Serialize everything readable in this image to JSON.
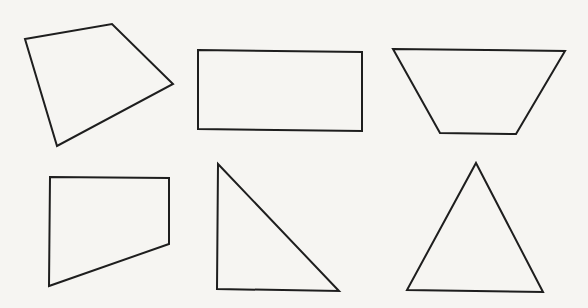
{
  "figure": {
    "width": 588,
    "height": 308,
    "background": "#f6f5f2",
    "stroke_color": "#1e1e1e",
    "shapes": [
      {
        "id": "irregular-quadrilateral",
        "type": "quadrilateral",
        "points": "25,39 112,24 173,84 57,146"
      },
      {
        "id": "rectangle",
        "type": "rectangle",
        "points": "198,50 362,52 362,131 198,129"
      },
      {
        "id": "isosceles-trapezoid",
        "type": "trapezoid",
        "points": "393,49 565,51 516,134 440,133"
      },
      {
        "id": "right-trapezoid",
        "type": "trapezoid",
        "points": "50,177 169,178 169,244 49,286"
      },
      {
        "id": "right-triangle",
        "type": "triangle",
        "points": "218,164 339,291 217,289"
      },
      {
        "id": "equilateral-triangle",
        "type": "triangle",
        "points": "476,163 543,292 407,290"
      }
    ]
  }
}
